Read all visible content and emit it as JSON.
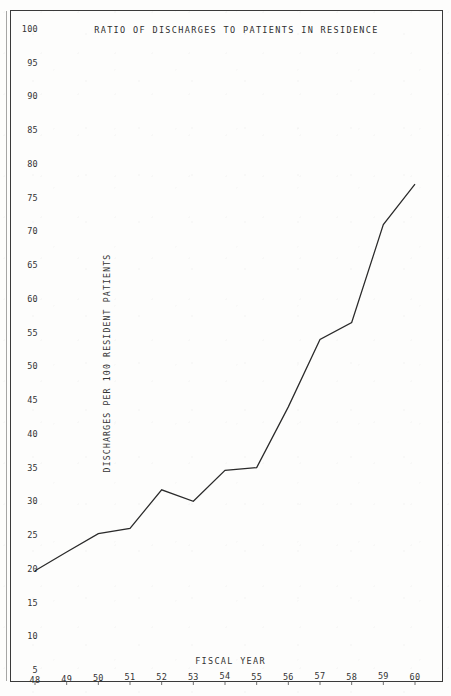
{
  "chart_data": {
    "type": "line",
    "title": "RATIO OF DISCHARGES TO PATIENTS IN RESIDENCE",
    "xlabel": "FISCAL YEAR",
    "ylabel": "DISCHARGES PER 100 RESIDENT PATIENTS",
    "categories": [
      "48",
      "49",
      "50",
      "51",
      "52",
      "53",
      "54",
      "55",
      "56",
      "57",
      "58",
      "59",
      "60"
    ],
    "values": [
      19.7,
      22.5,
      25.2,
      26.0,
      31.7,
      30.0,
      34.6,
      35.0,
      44.0,
      54.0,
      56.5,
      71.0,
      77.0
    ],
    "ylim": [
      5,
      100
    ],
    "ytick_step": 5,
    "yticks": [
      "100",
      "95",
      "90",
      "85",
      "80",
      "75",
      "70",
      "65",
      "60",
      "55",
      "50",
      "45",
      "40",
      "35",
      "30",
      "25",
      "20",
      "15",
      "10",
      "5"
    ],
    "grid": false,
    "legend": "none",
    "series": [
      {
        "name": "Discharges per 100 resident patients",
        "values": [
          19.7,
          22.5,
          25.2,
          26.0,
          31.7,
          30.0,
          34.6,
          35.0,
          44.0,
          54.0,
          56.5,
          71.0,
          77.0
        ]
      }
    ]
  },
  "colors": {
    "line": "#2a2a2a",
    "frame": "#3a3a3a",
    "text": "#333333",
    "paper": "#fdfdfc"
  }
}
